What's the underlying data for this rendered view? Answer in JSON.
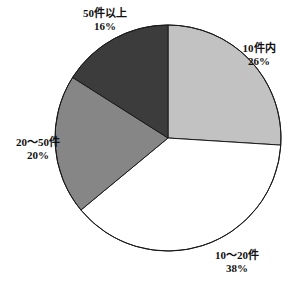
{
  "chart_data": {
    "type": "pie",
    "title": "",
    "subtitle": "",
    "xlabel": "",
    "ylabel": "",
    "legend_position": "none",
    "grid": false,
    "start_angle_deg": 0,
    "direction": "clockwise",
    "categories": [
      "10件内",
      "10～20件",
      "20～50件",
      "50件以上"
    ],
    "values": [
      26,
      38,
      20,
      16
    ],
    "value_suffix": "%",
    "colors": [
      "#c2c2c2",
      "#ffffff",
      "#868686",
      "#3c3c3c"
    ],
    "outline_color": "#1a1a1a",
    "slices": [
      {
        "id": "slice-10in",
        "label": "10件内",
        "value_text": "26%",
        "value": 26,
        "color": "#c2c2c2",
        "start_deg": 0,
        "end_deg": 93.6
      },
      {
        "id": "slice-10to20",
        "label": "10～20件",
        "value_text": "38%",
        "value": 38,
        "color": "#ffffff",
        "start_deg": 93.6,
        "end_deg": 230.4
      },
      {
        "id": "slice-20to50",
        "label": "20～50件",
        "value_text": "20%",
        "value": 20,
        "color": "#868686",
        "start_deg": 230.4,
        "end_deg": 302.4
      },
      {
        "id": "slice-50plus",
        "label": "50件以上",
        "value_text": "16%",
        "value": 16,
        "color": "#3c3c3c",
        "start_deg": 302.4,
        "end_deg": 360
      }
    ],
    "geometry": {
      "center_x": 168,
      "center_y": 138,
      "radius": 113
    },
    "background_color": "#ffffff"
  }
}
